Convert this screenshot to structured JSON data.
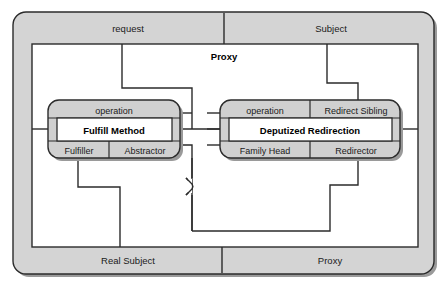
{
  "diagram": {
    "type": "role-model-composition",
    "colors": {
      "band_fill": "#d4d4d4",
      "box_fill": "#d0d0d0",
      "inner_fill": "#ffffff",
      "stroke": "#2b2b2b",
      "shadow": "#9a9a9a",
      "page_background": "#ffffff"
    },
    "outer_frame": {
      "name": "Proxy",
      "pattern_label": "Proxy",
      "top_band": {
        "left_label": "request",
        "right_label": "Subject"
      },
      "bottom_band": {
        "left_label": "Real Subject",
        "right_label": "Proxy"
      }
    },
    "role_boxes": [
      {
        "id": "left",
        "header": "operation",
        "header_right": "",
        "main": "Fulfill Method",
        "footer_left": "Fulfiller",
        "footer_right": "Abstractor"
      },
      {
        "id": "right",
        "header": "operation",
        "header_right": "Redirect Sibling",
        "main": "Deputized Redirection",
        "footer_left": "Family Head",
        "footer_right": "Redirector"
      }
    ],
    "connectors": [
      {
        "from": "request",
        "to": "left-box-header-right"
      },
      {
        "from": "Subject",
        "to": "redirect-sibling"
      },
      {
        "from": "fulfiller",
        "to": "real-subject"
      },
      {
        "from": "abstractor",
        "to": "proxy-bottom"
      },
      {
        "from": "left-box",
        "to": "right-box"
      },
      {
        "from": "redirector",
        "to": "proxy-bottom"
      }
    ]
  }
}
